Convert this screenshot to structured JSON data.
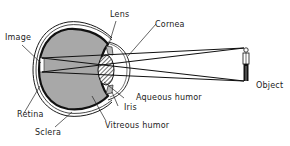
{
  "diagram": {
    "labels": {
      "lens": "Lens",
      "cornea": "Cornea",
      "image": "Image",
      "object": "Object",
      "aqueous_humor": "Aqueous humor",
      "iris": "Iris",
      "retina": "Retina",
      "sclera": "Sclera",
      "vitreous_humor": "Vitreous humor"
    },
    "colors": {
      "vitreous_fill": "#a8a8a8",
      "outline": "#1a1a1a",
      "background": "#ffffff"
    }
  }
}
